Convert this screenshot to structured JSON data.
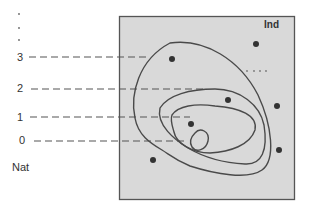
{
  "diagram": {
    "type": "contour-levels",
    "axis_labels": {
      "bottom_left": "Nat",
      "top_right": "Ind"
    },
    "levels": [
      {
        "label": "3",
        "y": 57
      },
      {
        "label": "2",
        "y": 89
      },
      {
        "label": "1",
        "y": 117
      },
      {
        "label": "0",
        "y": 141
      }
    ],
    "continuation_marks": [
      "·",
      "·",
      "·"
    ],
    "region_colors": {
      "panel_fill": "#d9d9d9",
      "panel_border": "#555555",
      "contour_stroke": "#4a4a4a",
      "dash_stroke": "#555555",
      "dot_fill": "#333333"
    },
    "points": [
      {
        "x": 172,
        "y": 59
      },
      {
        "x": 256,
        "y": 44
      },
      {
        "x": 228,
        "y": 100
      },
      {
        "x": 277,
        "y": 106
      },
      {
        "x": 191,
        "y": 124
      },
      {
        "x": 279,
        "y": 150
      },
      {
        "x": 153,
        "y": 160
      }
    ],
    "ellipsis_mark": "· · ·"
  }
}
